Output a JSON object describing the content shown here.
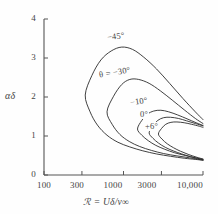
{
  "figure": {
    "background_color": "#fefefe",
    "line_color": "#2b2b2b",
    "axis_color": "#555555"
  },
  "axes": {
    "x": {
      "title": "ℛ = Uδ/ν∞",
      "scale": "log",
      "tick_labels": [
        "100",
        "300",
        "1000",
        "3000",
        "10,000"
      ],
      "tick_values": [
        100,
        300,
        1000,
        3000,
        10000
      ],
      "range": [
        100,
        10000
      ]
    },
    "y": {
      "title": "αδ",
      "scale": "linear",
      "tick_labels": [
        "0",
        "1",
        "2",
        "3",
        "4"
      ],
      "tick_values": [
        0,
        1,
        2,
        3,
        4
      ],
      "range": [
        0,
        4
      ]
    }
  },
  "curve_labels": [
    {
      "text": "−45°",
      "series": "-45"
    },
    {
      "text": "θ = −30°",
      "series": "-30"
    },
    {
      "text": "−10°",
      "series": "-10"
    },
    {
      "text": "0°",
      "series": "0"
    },
    {
      "text": "+6°",
      "series": "+6"
    }
  ],
  "chart_data": {
    "type": "line",
    "title": "",
    "xlabel": "ℛ = Uδ/ν∞",
    "ylabel": "αδ",
    "xscale": "log",
    "yscale": "linear",
    "xlim": [
      100,
      10000
    ],
    "ylim": [
      0,
      4
    ],
    "grid": false,
    "legend": "inline-curve-labels",
    "annotations": [
      "−45°",
      "θ = −30°",
      "−10°",
      "0°",
      "+6°"
    ],
    "series": [
      {
        "name": "-45°",
        "upper_branch": {
          "x": [
            330,
            400,
            520,
            700,
            950,
            1300,
            1800,
            2600,
            3800,
            5600,
            8000,
            10000
          ],
          "y": [
            2.05,
            2.55,
            2.95,
            3.18,
            3.28,
            3.22,
            3.02,
            2.72,
            2.35,
            1.96,
            1.62,
            1.42
          ]
        },
        "lower_branch": {
          "x": [
            330,
            380,
            470,
            620,
            850,
            1200,
            1750,
            2600,
            3900,
            5800,
            8000,
            10000
          ],
          "y": [
            2.05,
            1.62,
            1.28,
            1.02,
            0.84,
            0.72,
            0.62,
            0.54,
            0.48,
            0.43,
            0.4,
            0.38
          ]
        },
        "nose": {
          "x": 330,
          "y": 2.05
        },
        "peak": {
          "x": 1000,
          "y": 3.3
        }
      },
      {
        "name": "-30°",
        "upper_branch": {
          "x": [
            620,
            750,
            950,
            1200,
            1550,
            2100,
            2900,
            4100,
            5900,
            8000,
            10000
          ],
          "y": [
            1.62,
            2.02,
            2.32,
            2.45,
            2.45,
            2.35,
            2.16,
            1.92,
            1.66,
            1.45,
            1.32
          ]
        },
        "lower_branch": {
          "x": [
            620,
            720,
            900,
            1180,
            1600,
            2250,
            3200,
            4700,
            6800,
            10000
          ],
          "y": [
            1.62,
            1.3,
            1.04,
            0.86,
            0.73,
            0.63,
            0.55,
            0.49,
            0.44,
            0.38
          ]
        },
        "nose": {
          "x": 620,
          "y": 1.62
        },
        "peak": {
          "x": 1350,
          "y": 2.46
        }
      },
      {
        "name": "-10°",
        "upper_branch": {
          "x": [
            1500,
            1700,
            2000,
            2400,
            2950,
            3700,
            4800,
            6300,
            8200,
            10000
          ],
          "y": [
            1.18,
            1.4,
            1.56,
            1.64,
            1.66,
            1.62,
            1.54,
            1.44,
            1.34,
            1.27
          ]
        },
        "lower_branch": {
          "x": [
            1500,
            1700,
            2050,
            2550,
            3300,
            4400,
            6000,
            8000,
            10000
          ],
          "y": [
            1.18,
            1.02,
            0.88,
            0.76,
            0.66,
            0.57,
            0.5,
            0.44,
            0.4
          ]
        },
        "nose": {
          "x": 1500,
          "y": 1.18
        },
        "peak": {
          "x": 3100,
          "y": 1.66
        }
      },
      {
        "name": "0°",
        "upper_branch": {
          "x": [
            2100,
            2350,
            2700,
            3200,
            3900,
            4900,
            6200,
            8000,
            10000
          ],
          "y": [
            1.08,
            1.26,
            1.4,
            1.47,
            1.48,
            1.45,
            1.39,
            1.32,
            1.26
          ]
        },
        "lower_branch": {
          "x": [
            2100,
            2350,
            2750,
            3350,
            4200,
            5400,
            7000,
            10000
          ],
          "y": [
            1.08,
            0.94,
            0.82,
            0.71,
            0.62,
            0.54,
            0.47,
            0.39
          ]
        },
        "nose": {
          "x": 2100,
          "y": 1.08
        },
        "peak": {
          "x": 3900,
          "y": 1.48
        }
      },
      {
        "name": "+6°",
        "upper_branch": {
          "x": [
            2750,
            3000,
            3400,
            3950,
            4700,
            5800,
            7200,
            9000,
            10000
          ],
          "y": [
            1.05,
            1.19,
            1.3,
            1.35,
            1.36,
            1.34,
            1.3,
            1.25,
            1.22
          ]
        },
        "lower_branch": {
          "x": [
            2750,
            3050,
            3550,
            4250,
            5200,
            6500,
            8200,
            10000
          ],
          "y": [
            1.05,
            0.92,
            0.8,
            0.7,
            0.61,
            0.53,
            0.46,
            0.41
          ]
        },
        "nose": {
          "x": 2750,
          "y": 1.05
        },
        "peak": {
          "x": 4800,
          "y": 1.36
        }
      }
    ]
  }
}
